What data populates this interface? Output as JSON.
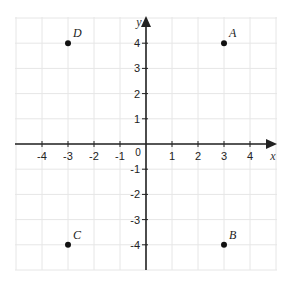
{
  "chart_data": {
    "type": "scatter",
    "title": "",
    "xlabel": "x",
    "ylabel": "y",
    "xlim": [
      -5,
      5
    ],
    "ylim": [
      -5,
      5
    ],
    "grid": true,
    "x_ticks": [
      -4,
      -3,
      -2,
      -1,
      1,
      2,
      3,
      4
    ],
    "y_ticks": [
      -4,
      -3,
      -2,
      -1,
      1,
      2,
      3,
      4
    ],
    "origin_label": "0",
    "points": [
      {
        "label": "A",
        "x": 3,
        "y": 4
      },
      {
        "label": "B",
        "x": 3,
        "y": -4
      },
      {
        "label": "C",
        "x": -3,
        "y": -4
      },
      {
        "label": "D",
        "x": -3,
        "y": 4
      }
    ]
  },
  "axes": {
    "x_name": "x",
    "y_name": "y",
    "origin": "0"
  },
  "colors": {
    "grid": "#e6e6e6",
    "axis": "#222222",
    "point": "#111111"
  }
}
